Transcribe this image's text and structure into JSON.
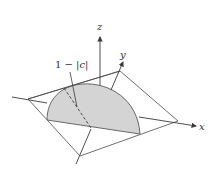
{
  "figure": {
    "axes": {
      "x_label": "x",
      "y_label": "y",
      "z_label": "z"
    },
    "annotation": {
      "prefix": "1 − |",
      "var": "c",
      "suffix": "|"
    },
    "colors": {
      "line": "#3a3a3a",
      "fill": "#d4d4d4",
      "background": "#ffffff"
    }
  }
}
